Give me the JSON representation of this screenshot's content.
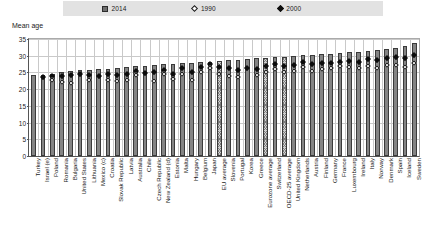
{
  "legend": {
    "items": [
      {
        "label": "2014",
        "marker": "filled-square-icon",
        "color": "#6e6e6e"
      },
      {
        "label": "1990",
        "marker": "open-diamond-icon",
        "color": "#ffffff"
      },
      {
        "label": "2000",
        "marker": "solid-diamond-icon",
        "color": "#0f0f0f"
      }
    ]
  },
  "axis": {
    "y_title": "Mean age"
  },
  "chart_data": {
    "type": "bar",
    "title": "Mean age",
    "xlabel": "",
    "ylabel": "Mean age",
    "ylim": [
      0,
      35
    ],
    "yticks": [
      0,
      5,
      10,
      15,
      20,
      25,
      30,
      35
    ],
    "grid": true,
    "legend_position": "top",
    "categories": [
      "Turkey",
      "Israel (e)",
      "Poland",
      "Romania",
      "Bulgaria",
      "United States",
      "Lithuania",
      "Mexico (c)",
      "Croatia",
      "Slovak Republic",
      "Latvia",
      "Australia",
      "Chile",
      "Czech Republic",
      "New Zealand (d)",
      "Estonia",
      "Malta",
      "Hungary",
      "Belgium",
      "Japan",
      "EU average",
      "Slovenia",
      "Portugal",
      "Korea",
      "Greece",
      "Eurozone average",
      "Switzerland",
      "OECD-25 average",
      "United Kingdom",
      "Netherlands",
      "Austria",
      "Finland",
      "Germany",
      "France",
      "Luxembourg",
      "Ireland",
      "Italy",
      "Norway",
      "Denmark",
      "Spain",
      "Iceland",
      "Sweden"
    ],
    "series": [
      {
        "name": "2014",
        "type": "bar",
        "values": [
          24.2,
          24.3,
          24.6,
          25.1,
          25.3,
          25.6,
          25.7,
          25.9,
          26.1,
          26.3,
          26.6,
          26.8,
          27.0,
          27.2,
          27.4,
          27.5,
          27.7,
          27.8,
          28.0,
          28.2,
          28.5,
          28.6,
          28.8,
          29.0,
          29.2,
          29.4,
          29.6,
          29.7,
          29.9,
          30.1,
          30.3,
          30.5,
          30.6,
          30.8,
          31.0,
          31.2,
          31.4,
          31.6,
          31.9,
          32.2,
          32.8,
          33.8
        ]
      },
      {
        "name": "2000",
        "type": "scatter",
        "marker": "solid-diamond",
        "values": [
          null,
          23.7,
          23.8,
          23.9,
          24.2,
          24.4,
          24.1,
          24.0,
          24.4,
          24.3,
          24.5,
          25.5,
          24.8,
          25.0,
          25.8,
          24.6,
          26.2,
          25.2,
          26.6,
          27.4,
          26.6,
          26.4,
          25.6,
          26.3,
          26.1,
          26.9,
          27.6,
          26.8,
          27.2,
          28.1,
          27.4,
          27.8,
          27.9,
          28.0,
          28.4,
          28.2,
          28.9,
          28.6,
          29.2,
          29.6,
          29.4,
          30.2
        ]
      },
      {
        "name": "1990",
        "type": "scatter",
        "marker": "open-diamond",
        "values": [
          null,
          null,
          22.6,
          22.2,
          21.8,
          null,
          22.8,
          null,
          22.6,
          22.5,
          22.6,
          24.3,
          null,
          22.4,
          24.6,
          22.9,
          24.4,
          22.8,
          25.0,
          26.3,
          24.6,
          23.8,
          23.6,
          null,
          24.1,
          25.0,
          26.1,
          25.0,
          25.5,
          26.6,
          25.4,
          26.1,
          26.4,
          26.8,
          26.5,
          26.3,
          27.0,
          26.4,
          27.3,
          27.1,
          26.7,
          27.9
        ]
      }
    ],
    "highlighted_categories": [
      "EU average",
      "Eurozone average",
      "OECD-25 average"
    ]
  }
}
